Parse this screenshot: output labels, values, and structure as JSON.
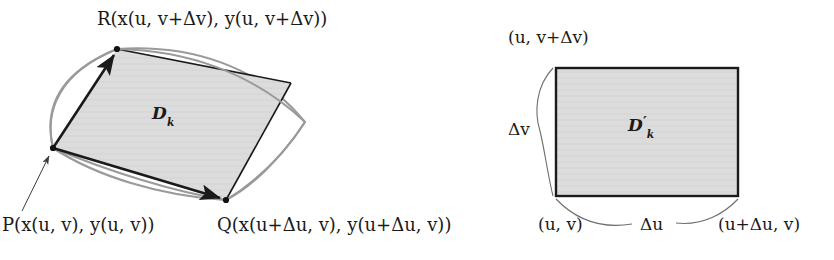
{
  "figure": {
    "background_color": "#ffffff",
    "ink_color": "#1a1a1a",
    "fill_color": "#dcdcdc",
    "curve_color": "#8a8a8a"
  },
  "left_figure": {
    "name": "image-region-xy-plane",
    "region_label": {
      "base": "D",
      "subscript": "k",
      "text": "Dk"
    },
    "vertices": [
      {
        "id": "P",
        "label_text": "P(x(u, v), y(u, v))",
        "point_name": "P",
        "arg_x": "x(u, v)",
        "arg_y": "y(u, v)",
        "position": {
          "x": 53,
          "y": 148
        }
      },
      {
        "id": "Q",
        "label_text": "Q(x(u+Δu, v), y(u+Δu, v))",
        "point_name": "Q",
        "arg_x": "x(u+Δu, v)",
        "arg_y": "y(u+Δu, v)",
        "position": {
          "x": 226,
          "y": 200
        }
      },
      {
        "id": "R",
        "label_text": "R(x(u, v+Δv), y(u, v+Δv))",
        "point_name": "R",
        "arg_x": "x(u, v+Δv)",
        "arg_y": "y(u, v+Δv)",
        "position": {
          "x": 117,
          "y": 49
        }
      }
    ],
    "vectors": [
      {
        "from": "P",
        "to": "Q",
        "style": "black-arrow"
      },
      {
        "from": "P",
        "to": "R",
        "style": "black-arrow"
      }
    ],
    "pointer_arrow": {
      "from_label": "P",
      "to_vertex": "P"
    }
  },
  "right_figure": {
    "name": "parameter-rectangle-uv-plane",
    "region_label": {
      "base": "D",
      "prime": "′",
      "subscript": "k",
      "text": "D′k"
    },
    "rect": {
      "left": 556,
      "top": 68,
      "right": 738,
      "bottom": 196
    },
    "corner_labels": [
      {
        "id": "bottom-left",
        "text": "(u, v)"
      },
      {
        "id": "top-left",
        "text": "(u, v+Δv)"
      },
      {
        "id": "bottom-right",
        "text": "(u+Δu, v)"
      }
    ],
    "dimension_labels": [
      {
        "id": "width",
        "text": "Δu",
        "brace": "bottom-horizontal"
      },
      {
        "id": "height",
        "text": "Δv",
        "brace": "left-vertical"
      }
    ]
  }
}
